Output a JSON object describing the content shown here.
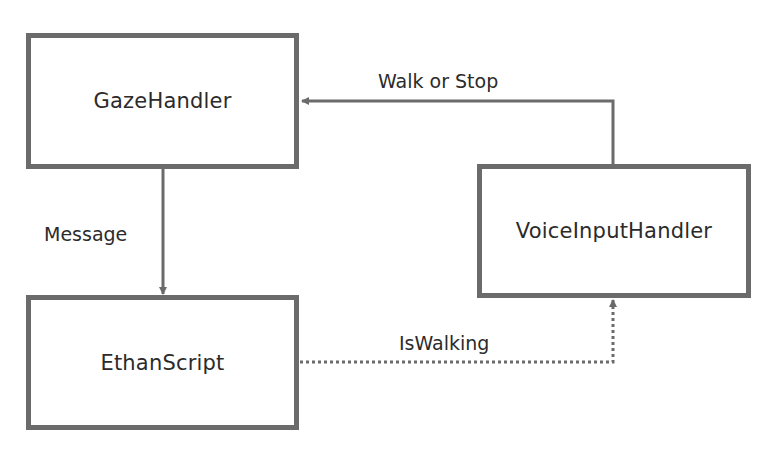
{
  "nodes": [
    {
      "id": "gaze",
      "label": "GazeHandler"
    },
    {
      "id": "voice",
      "label": "VoiceInputHandler"
    },
    {
      "id": "ethan",
      "label": "EthanScript"
    }
  ],
  "edges": [
    {
      "from": "voice",
      "to": "gaze",
      "label": "Walk or Stop",
      "style": "solid"
    },
    {
      "from": "gaze",
      "to": "ethan",
      "label": "Message",
      "style": "solid"
    },
    {
      "from": "ethan",
      "to": "voice",
      "label": "IsWalking",
      "style": "dotted"
    }
  ],
  "colors": {
    "stroke": "#6b6b6b",
    "text": "#2b2b2b",
    "background": "#ffffff"
  }
}
